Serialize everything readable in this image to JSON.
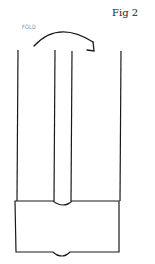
{
  "figure": {
    "label": "Fig 2",
    "annotation": "FOLD",
    "arrow_direction": "left-to-right",
    "stroke_color": "#1a1a1a",
    "annotation_color": "#888888"
  }
}
